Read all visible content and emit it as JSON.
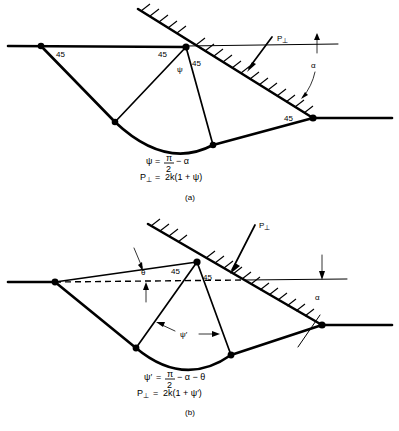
{
  "figure": {
    "panels": [
      {
        "id": "a",
        "caption": "(a)",
        "labels": {
          "angle_left": "45",
          "angle_apex_left": "45",
          "angle_apex_right": "45",
          "angle_right": "45",
          "psi": "ψ",
          "alpha": "α",
          "force": "P",
          "force_sub": "⊥"
        },
        "equations": [
          {
            "lhs": "ψ",
            "eq": "=",
            "numerator": "π",
            "denominator": "2",
            "tail": "− α"
          },
          {
            "lhs": "P",
            "lhs_sub": "⊥",
            "eq": "=",
            "rhs": "2k(1 + ψ)"
          }
        ]
      },
      {
        "id": "b",
        "caption": "(b)",
        "labels": {
          "angle_apex_left": "45",
          "angle_apex_right": "45",
          "theta": "θ",
          "psi_prime": "ψ′",
          "alpha": "α",
          "force": "P",
          "force_sub": "⊥"
        },
        "equations": [
          {
            "lhs": "ψ′",
            "eq": "=",
            "numerator": "π",
            "denominator": "2",
            "tail": "− α − θ"
          },
          {
            "lhs": "P",
            "lhs_sub": "⊥",
            "eq": "=",
            "rhs": "2k(1 + ψ′)"
          }
        ]
      }
    ],
    "colors": {
      "ink": "#000000",
      "paper": "#ffffff"
    }
  }
}
